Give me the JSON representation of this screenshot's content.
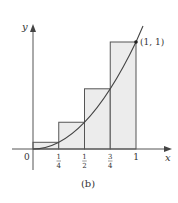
{
  "figure": {
    "caption": "(b)",
    "axes": {
      "x_label": "x",
      "y_label": "y",
      "origin_label": "0"
    },
    "x_ticks": [
      {
        "value": 0.25,
        "num": "1",
        "den": "4"
      },
      {
        "value": 0.5,
        "num": "1",
        "den": "2"
      },
      {
        "value": 0.75,
        "num": "3",
        "den": "4"
      },
      {
        "value": 1,
        "label": "1"
      }
    ],
    "point_label": "(1, 1)",
    "curve": "y = x^2",
    "rectangles": [
      {
        "x0": 0,
        "x1": 0.25,
        "height": 0.0625
      },
      {
        "x0": 0.25,
        "x1": 0.5,
        "height": 0.25
      },
      {
        "x0": 0.5,
        "x1": 0.75,
        "height": 0.5625
      },
      {
        "x0": 0.75,
        "x1": 1,
        "height": 1
      }
    ],
    "colors": {
      "fill": "#ececec",
      "line": "#444444",
      "axis": "#555555"
    }
  }
}
